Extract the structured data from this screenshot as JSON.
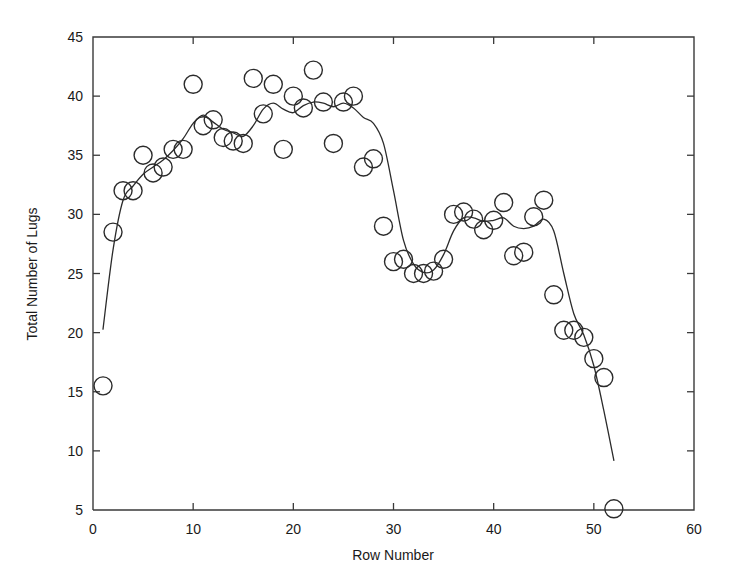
{
  "chart_data": {
    "type": "scatter",
    "title": "",
    "subtitle": "",
    "xlabel": "Row Number",
    "ylabel": "Total Number of Lugs",
    "xlim": [
      0,
      60
    ],
    "ylim": [
      5,
      45
    ],
    "xticks": [
      0,
      10,
      20,
      30,
      40,
      50,
      60
    ],
    "yticks": [
      5,
      10,
      15,
      20,
      25,
      30,
      35,
      40,
      45
    ],
    "xtick_labels": [
      "0",
      "10",
      "20",
      "30",
      "40",
      "50",
      "60"
    ],
    "ytick_labels": [
      "5",
      "10",
      "15",
      "20",
      "25",
      "30",
      "35",
      "40",
      "45"
    ],
    "grid": false,
    "legend": null,
    "legend_position": "none",
    "marker_style": "open-circle",
    "marker_color": "#2b2b2b",
    "line_color": "#2b2b2b",
    "series": [
      {
        "name": "Observed lugs",
        "type": "scatter",
        "x": [
          1,
          2,
          3,
          4,
          5,
          6,
          7,
          8,
          9,
          10,
          11,
          12,
          13,
          14,
          15,
          16,
          17,
          18,
          19,
          20,
          21,
          22,
          23,
          24,
          25,
          26,
          27,
          28,
          29,
          30,
          31,
          32,
          33,
          34,
          35,
          36,
          37,
          38,
          39,
          40,
          41,
          42,
          43,
          44,
          45,
          46,
          47,
          48,
          49,
          50,
          51,
          52
        ],
        "y": [
          15.5,
          28.5,
          32.0,
          32.0,
          35.0,
          33.5,
          34.0,
          35.5,
          35.5,
          41.0,
          37.5,
          38.0,
          36.5,
          36.2,
          36.0,
          41.5,
          38.5,
          41.0,
          35.5,
          40.0,
          39.0,
          42.2,
          39.5,
          36.0,
          39.5,
          40.0,
          34.0,
          34.7,
          29.0,
          26.0,
          26.2,
          25.0,
          25.0,
          25.2,
          26.2,
          30.0,
          30.2,
          29.6,
          28.7,
          29.5,
          31.0,
          26.5,
          26.8,
          29.8,
          31.2,
          23.2,
          20.2,
          20.2,
          19.6,
          17.8,
          16.2,
          5.1
        ]
      },
      {
        "name": "Smoothed fit",
        "type": "line",
        "x": [
          1.0,
          2.0,
          3.0,
          4.0,
          5.0,
          6.0,
          7.0,
          8.0,
          9.0,
          10.0,
          11.0,
          12.0,
          13.0,
          14.0,
          15.0,
          16.0,
          17.0,
          18.0,
          19.0,
          20.0,
          21.0,
          22.0,
          23.0,
          24.0,
          25.0,
          26.0,
          27.0,
          28.0,
          29.0,
          30.0,
          31.0,
          32.0,
          33.0,
          34.0,
          35.0,
          36.0,
          37.0,
          38.0,
          39.0,
          40.0,
          41.0,
          42.0,
          43.0,
          44.0,
          45.0,
          46.0,
          47.0,
          48.0,
          49.0,
          50.0,
          51.0,
          52.0
        ],
        "y": [
          20.3,
          27.0,
          31.2,
          32.4,
          33.4,
          34.0,
          34.6,
          35.4,
          36.4,
          37.7,
          38.4,
          37.8,
          37.2,
          36.9,
          36.6,
          37.5,
          38.9,
          39.4,
          38.9,
          38.6,
          39.2,
          39.5,
          39.4,
          39.1,
          39.4,
          39.0,
          38.2,
          37.7,
          36.0,
          32.0,
          27.8,
          25.8,
          25.1,
          25.3,
          26.6,
          28.6,
          29.7,
          29.7,
          29.4,
          29.5,
          29.7,
          29.0,
          28.8,
          29.0,
          29.6,
          28.6,
          25.0,
          21.6,
          19.8,
          17.2,
          13.4,
          9.2
        ]
      }
    ]
  },
  "axes": {
    "x_title": "Row Number",
    "y_title": "Total Number of Lugs"
  }
}
